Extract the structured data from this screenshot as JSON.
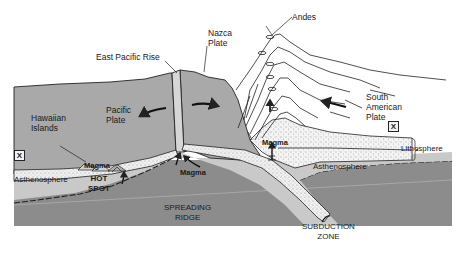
{
  "diagram": {
    "colors": {
      "background": "#ffffff",
      "plate_gray": "#a8a8a8",
      "mantle_dark": "#8a8a8a",
      "asthenosphere_light": "#c9c9c9",
      "lithosphere_dotted": "#ececec",
      "outline": "#222222"
    },
    "labels": {
      "andes": "Andes",
      "nazca_plate": "Nazca\nPlate",
      "east_pacific_rise": "East Pacific Rise",
      "pacific_plate": "Pacific\nPlate",
      "hawaiian_islands": "Hawaiian\nIslands",
      "south_american_plate": "South\nAmerican\nPlate",
      "x_marker_left": "X",
      "x_marker_right": "X",
      "lithosphere": "Lithosphere",
      "asthenosphere_left": "Asthenosphere",
      "asthenosphere_right": "Asthenosphere",
      "magma_hotspot": "Magma",
      "hot_spot": "HOT\nSPOT",
      "magma_ridge": "Magma",
      "magma_andes": "Magma",
      "spreading_ridge": "SPREADING\nRIDGE",
      "subduction_zone": "SUBDUCTION\nZONE"
    },
    "icons": {
      "plate_motion_arrows": [
        "arrow-left-pacific",
        "arrow-right-nazca",
        "arrow-left-south-american"
      ],
      "magma_arrows": [
        "arrow-up-hotspot",
        "arrow-up-ridge",
        "arrow-up-andes"
      ],
      "x_markers": [
        "x-marker-left",
        "x-marker-right"
      ]
    }
  }
}
